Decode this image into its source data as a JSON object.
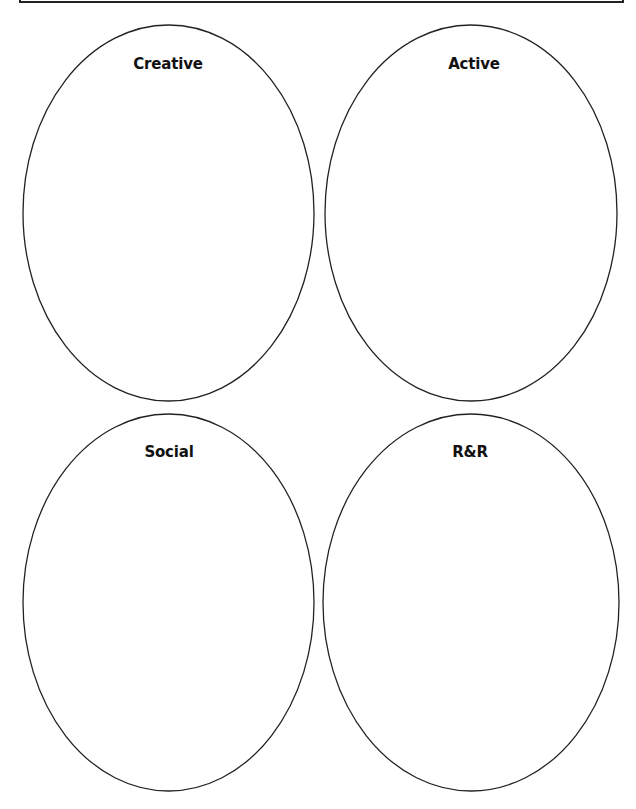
{
  "title_box": {
    "text": ""
  },
  "circles": [
    {
      "label": "Creative"
    },
    {
      "label": "Active"
    },
    {
      "label": "Social"
    },
    {
      "label": "R&R"
    }
  ],
  "colors": {
    "stroke": "#222222",
    "background": "#ffffff",
    "text": "#111111"
  }
}
